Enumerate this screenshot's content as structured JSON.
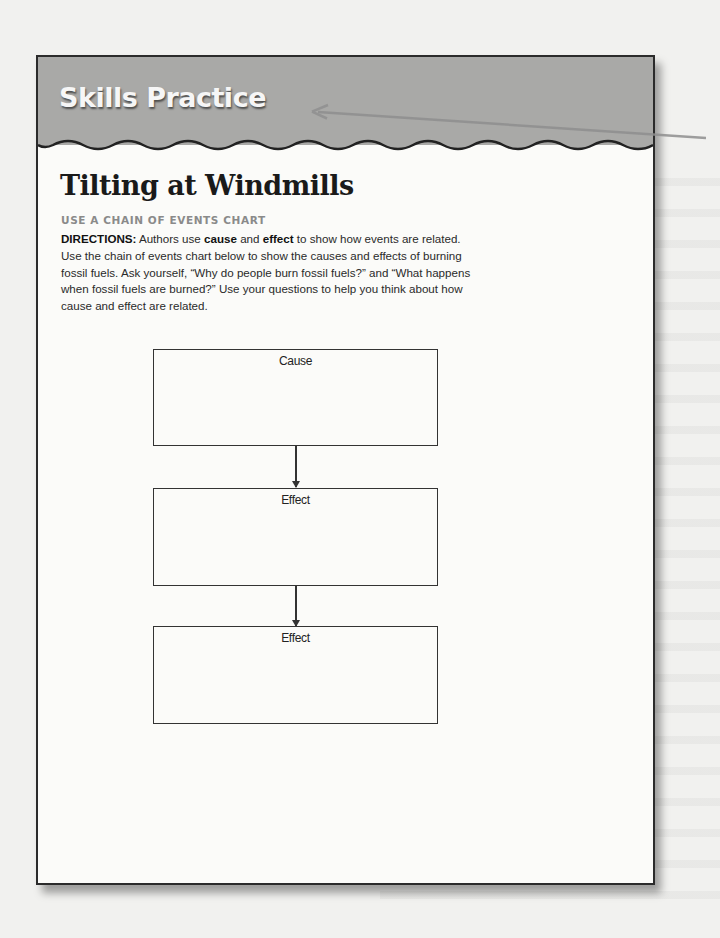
{
  "header": {
    "band_title": "Skills Practice"
  },
  "worksheet": {
    "title": "Tilting at Windmills",
    "subtitle": "USE A CHAIN OF EVENTS CHART",
    "directions": {
      "lead": "DIRECTIONS:",
      "part1": " Authors use ",
      "bold1": "cause",
      "part2": " and ",
      "bold2": "effect",
      "part3": " to show how events are related. Use the chain of events chart below to show the causes and effects of burning fossil fuels. Ask yourself, “Why do people burn fossil fuels?” and “What happens when fossil fuels are burned?” Use your questions to help you think about how cause and effect are related."
    }
  },
  "chart": {
    "boxes": [
      {
        "label": "Cause"
      },
      {
        "label": "Effect"
      },
      {
        "label": "Effect"
      }
    ]
  },
  "colors": {
    "band": "#a9a9a7",
    "page": "#fbfbf9",
    "background": "#f1f1ef",
    "callout_arrow": "#8f8f8f"
  }
}
